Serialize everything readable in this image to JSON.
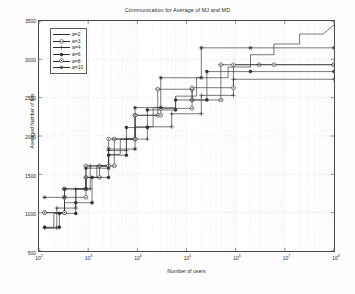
{
  "chart_data": {
    "type": "line",
    "title": "Communication for Average of MJ and MD",
    "xlabel": "Number of users",
    "ylabel": "Averaged Number of bits",
    "xscale": "log",
    "yscale": "linear",
    "xlim": [
      100,
      100000000
    ],
    "ylim": [
      500,
      3500
    ],
    "grid": true,
    "legend_position": "upper-left",
    "xticklabels": [
      "10^2",
      "10^3",
      "10^4",
      "10^5",
      "10^6",
      "10^7",
      "10^8"
    ],
    "xtickvalues": [
      100,
      1000,
      10000,
      100000,
      1000000,
      10000000,
      100000000
    ],
    "yticklabels": [
      "500",
      "1000",
      "1500",
      "2000",
      "2500",
      "3000",
      "3500"
    ],
    "ytickvalues": [
      500,
      1000,
      1500,
      2000,
      2500,
      3000,
      3500
    ],
    "series": [
      {
        "name": "a=2",
        "marker": "none",
        "points": [
          [
            130,
            800
          ],
          [
            200,
            800
          ],
          [
            200,
            990
          ],
          [
            330,
            990
          ],
          [
            330,
            1130
          ],
          [
            560,
            1130
          ],
          [
            560,
            1310
          ],
          [
            900,
            1310
          ],
          [
            900,
            1460
          ],
          [
            1500,
            1460
          ],
          [
            1500,
            1610
          ],
          [
            2600,
            1610
          ],
          [
            2600,
            1760
          ],
          [
            4500,
            1760
          ],
          [
            4500,
            1960
          ],
          [
            9000,
            1960
          ],
          [
            9000,
            2120
          ],
          [
            21000,
            2120
          ],
          [
            21000,
            2370
          ],
          [
            60000,
            2370
          ],
          [
            60000,
            2520
          ],
          [
            160000,
            2520
          ],
          [
            160000,
            2760
          ],
          [
            700000,
            2760
          ],
          [
            700000,
            2900
          ],
          [
            2000000,
            2900
          ],
          [
            2000000,
            3060
          ],
          [
            6000000,
            3060
          ],
          [
            6000000,
            3200
          ],
          [
            20000000,
            3200
          ],
          [
            20000000,
            3330
          ],
          [
            60000000,
            3330
          ],
          [
            100000000,
            3450
          ]
        ]
      },
      {
        "name": "a=3",
        "marker": "circle-open",
        "points": [
          [
            130,
            1000
          ],
          [
            330,
            1000
          ],
          [
            330,
            1310
          ],
          [
            900,
            1310
          ],
          [
            900,
            1460
          ],
          [
            1700,
            1460
          ],
          [
            1700,
            1610
          ],
          [
            3400,
            1610
          ],
          [
            3400,
            1960
          ],
          [
            9000,
            1960
          ],
          [
            9000,
            2270
          ],
          [
            26000,
            2270
          ],
          [
            26000,
            2610
          ],
          [
            130000,
            2610
          ],
          [
            130000,
            2470
          ],
          [
            500000,
            2470
          ],
          [
            500000,
            2930
          ],
          [
            3000000,
            2930
          ],
          [
            100000000,
            2930
          ]
        ]
      },
      {
        "name": "a=4",
        "marker": "plus",
        "points": [
          [
            130,
            800
          ],
          [
            230,
            800
          ],
          [
            230,
            1060
          ],
          [
            560,
            1060
          ],
          [
            560,
            1310
          ],
          [
            1100,
            1310
          ],
          [
            1100,
            1610
          ],
          [
            2600,
            1610
          ],
          [
            2600,
            1810
          ],
          [
            6000,
            1810
          ],
          [
            6000,
            1960
          ],
          [
            16000,
            1960
          ],
          [
            16000,
            2120
          ],
          [
            50000,
            2120
          ],
          [
            50000,
            2290
          ],
          [
            200000,
            2290
          ],
          [
            200000,
            2530
          ],
          [
            900000,
            2530
          ],
          [
            900000,
            2740
          ],
          [
            100000000,
            2740
          ]
        ]
      },
      {
        "name": "a=6",
        "marker": "filled-dot",
        "points": [
          [
            130,
            810
          ],
          [
            260,
            810
          ],
          [
            260,
            990
          ],
          [
            560,
            990
          ],
          [
            560,
            1130
          ],
          [
            1200,
            1130
          ],
          [
            1200,
            1460
          ],
          [
            2600,
            1460
          ],
          [
            2600,
            1750
          ],
          [
            6000,
            1750
          ],
          [
            6000,
            2110
          ],
          [
            16000,
            2110
          ],
          [
            16000,
            2340
          ],
          [
            60000,
            2340
          ],
          [
            60000,
            2470
          ],
          [
            260000,
            2470
          ],
          [
            260000,
            2840
          ],
          [
            2000000,
            2840
          ],
          [
            100000000,
            2840
          ]
        ]
      },
      {
        "name": "a=8",
        "marker": "circle-dot",
        "points": [
          [
            130,
            1000
          ],
          [
            330,
            1000
          ],
          [
            330,
            1200
          ],
          [
            900,
            1200
          ],
          [
            900,
            1610
          ],
          [
            2600,
            1610
          ],
          [
            2600,
            1960
          ],
          [
            9000,
            1960
          ],
          [
            9000,
            2270
          ],
          [
            30000,
            2270
          ],
          [
            30000,
            2360
          ],
          [
            130000,
            2360
          ],
          [
            130000,
            2630
          ],
          [
            900000,
            2630
          ],
          [
            900000,
            2930
          ],
          [
            6000000,
            2930
          ],
          [
            100000000,
            2930
          ]
        ]
      },
      {
        "name": "a=10",
        "marker": "star",
        "points": [
          [
            130,
            1200
          ],
          [
            330,
            1200
          ],
          [
            330,
            1310
          ],
          [
            900,
            1310
          ],
          [
            900,
            1580
          ],
          [
            2600,
            1580
          ],
          [
            2600,
            1830
          ],
          [
            9000,
            1830
          ],
          [
            9000,
            2370
          ],
          [
            30000,
            2370
          ],
          [
            30000,
            2760
          ],
          [
            200000,
            2760
          ],
          [
            200000,
            3150
          ],
          [
            2000000,
            3150
          ],
          [
            100000000,
            3150
          ]
        ]
      }
    ]
  },
  "colors": {
    "line": "#2e2e2e",
    "axis": "#4a4a4a",
    "grid": "#c9c9c9",
    "background": "#ffffff",
    "text": "#2b2b2b"
  }
}
